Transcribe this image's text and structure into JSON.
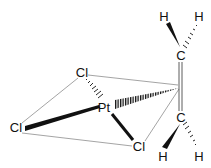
{
  "diagram": {
    "atoms": [
      {
        "id": "Pt",
        "label": "Pt",
        "x": 104,
        "y": 109
      },
      {
        "id": "Cl1",
        "label": "Cl",
        "x": 82,
        "y": 77
      },
      {
        "id": "Cl2",
        "label": "Cl",
        "x": 16,
        "y": 131
      },
      {
        "id": "Cl3",
        "label": "Cl",
        "x": 138,
        "y": 150
      },
      {
        "id": "C1",
        "label": "C",
        "x": 181,
        "y": 58
      },
      {
        "id": "C2",
        "label": "C",
        "x": 181,
        "y": 120
      },
      {
        "id": "H1",
        "label": "H",
        "x": 164,
        "y": 19
      },
      {
        "id": "H2",
        "label": "H",
        "x": 199,
        "y": 19
      },
      {
        "id": "H3",
        "label": "H",
        "x": 164,
        "y": 159
      },
      {
        "id": "H4",
        "label": "H",
        "x": 199,
        "y": 159
      }
    ],
    "colors": {
      "line": "#111111",
      "thin": "#555555",
      "background": "#ffffff"
    }
  }
}
